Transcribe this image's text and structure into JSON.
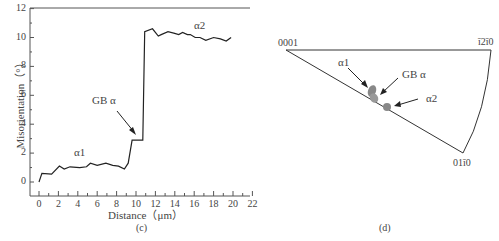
{
  "chart_data": [
    {
      "type": "line",
      "panel": "(c)",
      "title": "",
      "xlabel": "Distance（μm）",
      "ylabel": "Misorientation（°）",
      "xlim": [
        -1,
        22
      ],
      "ylim": [
        -1,
        12
      ],
      "xticks": [
        0,
        2,
        4,
        6,
        8,
        10,
        12,
        14,
        16,
        18,
        20,
        22
      ],
      "yticks": [
        0,
        2,
        4,
        6,
        8,
        10,
        12
      ],
      "grid": false,
      "series": [
        {
          "name": "misorientation profile",
          "x": [
            0,
            0.3,
            1.3,
            2.1,
            2.6,
            3.2,
            4.2,
            4.9,
            5.3,
            6.0,
            6.9,
            7.6,
            8.2,
            8.8,
            9.2,
            9.6,
            10.7,
            10.9,
            11.7,
            12.3,
            12.6,
            13.3,
            13.9,
            14.4,
            14.8,
            15.3,
            15.6,
            16.1,
            16.6,
            17.2,
            18.0,
            18.7,
            19.3,
            19.8
          ],
          "y": [
            0,
            0.6,
            0.55,
            1.1,
            0.9,
            1.05,
            1.0,
            1.05,
            1.3,
            1.15,
            1.3,
            1.15,
            1.1,
            0.9,
            1.3,
            2.9,
            2.9,
            10.4,
            10.6,
            10.1,
            10.2,
            10.4,
            10.3,
            10.2,
            10.35,
            10.2,
            10.2,
            10.0,
            10.0,
            9.8,
            10.0,
            9.9,
            9.75,
            10.0
          ]
        }
      ],
      "annotations": [
        {
          "text": "α1",
          "x": 4,
          "y": 2
        },
        {
          "text": "GB α",
          "x": 8.5,
          "y": 5.6,
          "arrow_to": [
            10,
            3
          ]
        },
        {
          "text": "α2",
          "x": 17,
          "y": 10.8
        }
      ]
    },
    {
      "type": "scatter",
      "panel": "(d)",
      "title": "Inverse pole figure",
      "vertices": [
        "0001",
        "ī2ī0",
        "01ī0"
      ],
      "points": [
        {
          "name": "α1",
          "label": "α1"
        },
        {
          "name": "GB α",
          "label": "GB α"
        },
        {
          "name": "α2",
          "label": "α2"
        }
      ]
    }
  ],
  "panel_c": {
    "caption": "(c)",
    "ylabel": "Misorientation（°）",
    "xlabel": "Distance（μm）",
    "xtick_labels": [
      "0",
      "2",
      "4",
      "6",
      "8",
      "10",
      "12",
      "14",
      "16",
      "18",
      "20",
      "22"
    ],
    "ytick_labels": [
      "0",
      "2",
      "4",
      "6",
      "8",
      "10",
      "12"
    ],
    "annot_a1": "α1",
    "annot_gb": "GB α",
    "annot_a2": "α2"
  },
  "panel_d": {
    "caption": "(d)",
    "vertex_0001": "0001",
    "vertex_1210": "ī2ī0",
    "vertex_0110": "01ī0",
    "annot_a1": "α1",
    "annot_gb": "GB α",
    "annot_a2": "α2"
  },
  "colors": {
    "line": "#222222",
    "axis": "#444444",
    "points": "#888888"
  }
}
